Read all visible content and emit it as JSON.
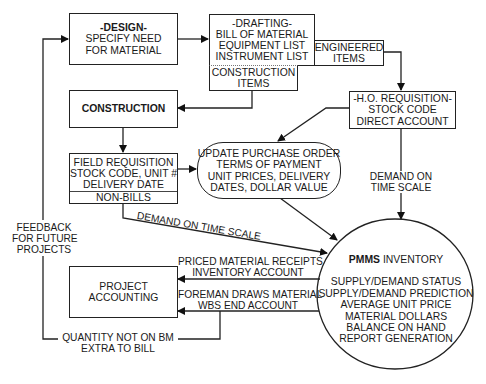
{
  "nodes": {
    "design": {
      "title": "-DESIGN-",
      "lines": [
        "SPECIFY NEED",
        "FOR MATERIAL"
      ]
    },
    "drafting": {
      "title": "-DRAFTING-",
      "lines": [
        "BILL OF MATERIAL",
        "EQUIPMENT LIST",
        "INSTRUMENT LIST"
      ]
    },
    "engineered_items": {
      "lines": [
        "ENGINEERED",
        "ITEMS"
      ]
    },
    "construction_items": {
      "lines": [
        "CONSTRUCTION",
        "ITEMS"
      ]
    },
    "construction": {
      "title": "CONSTRUCTION"
    },
    "ho_requisition": {
      "title": "-H.O. REQUISITION-",
      "lines": [
        "STOCK CODE",
        "DIRECT ACCOUNT"
      ]
    },
    "field_requisition": {
      "lines": [
        "FIELD REQUISITION",
        "STOCK CODE, UNIT #",
        "DELIVERY DATE"
      ],
      "footer": "NON-BILLS"
    },
    "update_po": {
      "lines": [
        "UPDATE PURCHASE ORDER",
        "TERMS OF PAYMENT",
        "UNIT PRICES, DELIVERY",
        "DATES, DOLLAR VALUE"
      ]
    },
    "project_accounting": {
      "lines": [
        "PROJECT",
        "ACCOUNTING"
      ]
    },
    "pmms": {
      "title_bold": "PMMS",
      "title_rest": " INVENTORY",
      "lines": [
        "SUPPLY/DEMAND STATUS",
        "SUPPLY/DEMAND PREDICTION",
        "AVERAGE UNIT PRICE",
        "MATERIAL DOLLARS",
        "BALANCE ON HAND",
        "REPORT GENERATION"
      ]
    }
  },
  "edge_labels": {
    "demand_right": [
      "DEMAND ON",
      "TIME SCALE"
    ],
    "demand_diagonal": "DEMAND ON TIME SCALE",
    "priced_receipts": [
      "PRICED MATERIAL RECEIPTS",
      "INVENTORY ACCOUNT"
    ],
    "foreman_draws": [
      "FOREMAN DRAWS MATERIAL",
      "WBS END ACCOUNT"
    ],
    "quantity_not_on_bm": [
      "QUANTITY NOT ON BM",
      "EXTRA TO BILL"
    ],
    "feedback": [
      "FEEDBACK",
      "FOR FUTURE",
      "PROJECTS"
    ]
  }
}
